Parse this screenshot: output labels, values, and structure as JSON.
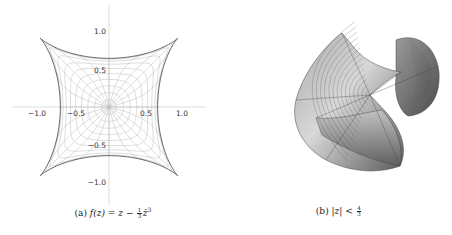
{
  "figure": {
    "panels": [
      {
        "id": "a",
        "caption": {
          "label": "(a)",
          "lhs": "f(z)",
          "eq": "=",
          "z": "z",
          "minus": "−",
          "frac_num": "1",
          "frac_den": "3",
          "zbar_cubed": "z̄",
          "exp": "3"
        }
      },
      {
        "id": "b",
        "caption": {
          "label": "(b)",
          "abs_z": "|z|",
          "lt": "<",
          "frac_num": "4",
          "frac_den": "3"
        }
      }
    ]
  },
  "chart_data": [
    {
      "type": "line",
      "title": "(a) f(z) = z − (1/3) z̄³",
      "description": "Image of the unit disk under the harmonic map f(z)=z−(1/3)z̄³: a four-cusped hypocycloid-like region with polar grid curves (images of circles and rays).",
      "xlabel": "",
      "ylabel": "",
      "xlim": [
        -1.3,
        1.3
      ],
      "ylim": [
        -1.35,
        1.35
      ],
      "x_ticks": [
        "-1.0",
        "-0.5",
        "0.5",
        "1.0"
      ],
      "y_ticks": [
        "1.0",
        "0.5",
        "-0.5",
        "-1.0"
      ],
      "grid": false,
      "boundary_cusps": [
        [
          0.943,
          0.943
        ],
        [
          -0.943,
          0.943
        ],
        [
          -0.943,
          -0.943
        ],
        [
          0.943,
          -0.943
        ]
      ],
      "boundary_edge_midpoints": [
        [
          0.667,
          0
        ],
        [
          0,
          0.667
        ],
        [
          -0.667,
          0
        ],
        [
          0,
          -0.667
        ]
      ],
      "radial_circles_r": [
        0.1,
        0.2,
        0.3,
        0.4,
        0.5,
        0.6,
        0.7,
        0.8,
        0.9,
        1.0
      ],
      "rays_count": 24,
      "colors": {
        "boundary": "#555555",
        "grid": "#bbbbbb",
        "axes": "#cccccc"
      }
    },
    {
      "type": "surface",
      "title": "(b) |z| < 4/3",
      "description": "3D rendered minimal-surface-like lift of the map over the disk |z|<4/3, shaded grey with polar mesh lines, showing a star-shaped center and folded lobes.",
      "colors": {
        "surface_light": "#d6d6d6",
        "surface_dark": "#555555",
        "mesh": "#444444"
      }
    }
  ],
  "ticks": {
    "x_neg1": "−1.0",
    "x_neg05": "−0.5",
    "x_05": "0.5",
    "x_1": "1.0",
    "y_1": "1.0",
    "y_05": "0.5",
    "y_neg05": "−0.5",
    "y_neg1": "−1.0"
  }
}
